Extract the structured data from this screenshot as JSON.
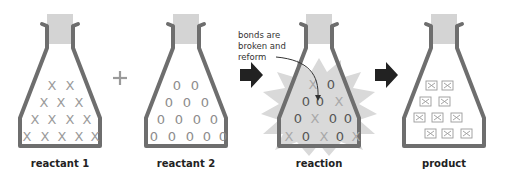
{
  "diagram": {
    "title": "",
    "colors": {
      "flask_outline": "#6e6e6e",
      "stopper": "#d4d4d4",
      "reactant_symbol": "#9a9a9a",
      "reaction_o": "#555555",
      "reaction_x": "#a8a8a8",
      "starburst": "#d9d9d9",
      "arrow": "#222222",
      "plus": "#9a9a9a"
    },
    "stages": [
      {
        "id": "reactant-1",
        "label": "reactant 1",
        "symbol": "X",
        "count": 14,
        "rows": [
          2,
          3,
          4,
          5
        ]
      },
      {
        "id": "reactant-2",
        "label": "reactant 2",
        "symbol": "O",
        "count": 14,
        "rows": [
          2,
          3,
          4,
          5
        ]
      },
      {
        "id": "reaction",
        "label": "reaction",
        "symbols": "mixed X and O",
        "annotation": "bonds are broken and reform"
      },
      {
        "id": "product",
        "label": "product",
        "symbol": "boxed X",
        "count": 10,
        "rows": [
          2,
          2,
          3,
          3
        ]
      }
    ],
    "operators": {
      "plus": "+",
      "arrow_1": "right-arrow",
      "arrow_2": "right-arrow"
    },
    "annotation": {
      "line1": "bonds are",
      "line2": "broken and",
      "line3": "reform"
    }
  }
}
